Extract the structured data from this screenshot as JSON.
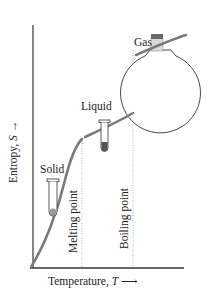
{
  "diagram": {
    "type": "entropy-vs-temperature phase diagram",
    "y_axis": {
      "label": "Entropy, ",
      "symbol": "S",
      "arrow": "→"
    },
    "x_axis": {
      "label": "Temperature, ",
      "symbol": "T",
      "arrow": "⟶"
    },
    "markers": [
      {
        "id": "melting",
        "label": "Melting point"
      },
      {
        "id": "boiling",
        "label": "Boiling point"
      }
    ],
    "phases": [
      {
        "id": "solid",
        "label": "Solid",
        "icon": "test-tube-solid-icon"
      },
      {
        "id": "liquid",
        "label": "Liquid",
        "icon": "test-tube-liquid-icon"
      },
      {
        "id": "gas",
        "label": "Gas",
        "icon": "round-flask-gas-icon"
      }
    ],
    "colors": {
      "curve": "#7a7a7a",
      "axis": "#333333",
      "dotted": "#b0b0b0",
      "liquid_fill": "#555555",
      "solid_fill": "#9a9a9a",
      "gas_stopper": "#d9d9d9",
      "gas_cap": "#666666"
    }
  }
}
